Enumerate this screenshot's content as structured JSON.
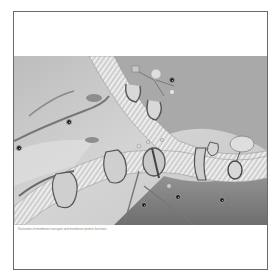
{
  "figure": {
    "caption": "Illustration of membrane transport and membrane protein functions",
    "colors": {
      "background": "#ffffff",
      "frame": "#6a6a6a",
      "cytoplasm_light": "#d2d2d2",
      "cytoplasm_dark": "#8a8a8a",
      "bilayer_stripe": "#f2f2f2",
      "protein_outline": "#555555",
      "marker": "#222222"
    },
    "markers": [
      {
        "id": "1",
        "x": 172,
        "y": 80
      },
      {
        "id": "2",
        "x": 69,
        "y": 122
      },
      {
        "id": "3",
        "x": 19,
        "y": 148
      },
      {
        "id": "4",
        "x": 144,
        "y": 205
      },
      {
        "id": "5",
        "x": 178,
        "y": 197
      },
      {
        "id": "6",
        "x": 222,
        "y": 200
      }
    ]
  }
}
